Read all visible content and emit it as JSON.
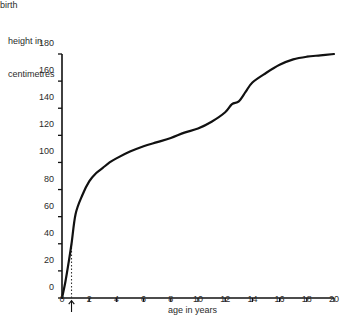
{
  "chart_data": {
    "type": "line",
    "title": "",
    "ylabel": "height in\ncentimetres",
    "ylabel_line1": "height in",
    "ylabel_line2": "centimetres",
    "xlabel": "age in years",
    "xlim": [
      0,
      20
    ],
    "ylim": [
      0,
      180
    ],
    "grid": false,
    "legend": null,
    "yticks": [
      0,
      20,
      40,
      60,
      80,
      100,
      120,
      140,
      160,
      180
    ],
    "xticks": [
      0,
      2,
      4,
      6,
      8,
      10,
      12,
      14,
      16,
      18,
      20
    ],
    "ytick_labels": [
      "0",
      "20",
      "40",
      "60",
      "80",
      "100",
      "120",
      "140",
      "160",
      "180"
    ],
    "xtick_labels": [
      "0",
      "2",
      "4",
      "6",
      "8",
      "10",
      "12",
      "14",
      "16",
      "18",
      "20"
    ],
    "annotations": [
      {
        "label": "birth",
        "x": 0.7,
        "y": 40,
        "marker": "up-arrow-below-axis",
        "guide": "dotted-vertical-line"
      }
    ],
    "series": [
      {
        "name": "height",
        "color": "#111111",
        "x": [
          0,
          0.25,
          0.5,
          0.7,
          1,
          1.5,
          2,
          2.5,
          3,
          3.5,
          4,
          5,
          6,
          7,
          8,
          9,
          10,
          11,
          12,
          12.5,
          13,
          13.5,
          14,
          15,
          16,
          17,
          18,
          19,
          20
        ],
        "y": [
          0,
          12,
          27,
          40,
          62,
          76,
          86,
          92,
          96,
          100,
          103,
          108,
          112,
          115,
          118,
          122,
          125,
          130,
          137,
          143,
          145,
          152,
          159,
          166,
          172,
          176,
          178,
          179,
          180
        ]
      }
    ]
  }
}
